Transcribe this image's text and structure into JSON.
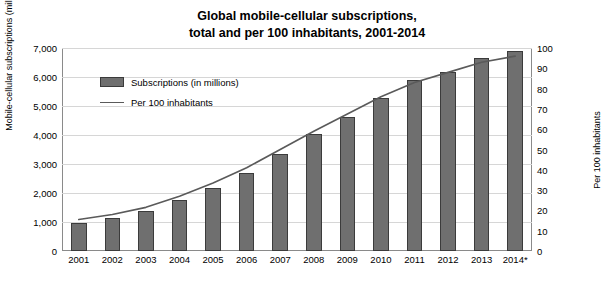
{
  "chart_data": {
    "type": "bar",
    "title": "Global mobile-cellular subscriptions, total and per 100 inhabitants, 2001-2014",
    "title_lines": [
      "Global mobile-cellular subscriptions,",
      "total and per 100 inhabitants, 2001-2014"
    ],
    "xlabel": "",
    "ylabel": "Mobile-cellular subscriptions  (millions)",
    "y2label": "Per 100 inhabitants",
    "categories": [
      "2001",
      "2002",
      "2003",
      "2004",
      "2005",
      "2006",
      "2007",
      "2008",
      "2009",
      "2010",
      "2011",
      "2012",
      "2013",
      "2014*"
    ],
    "ylim": [
      0,
      7000
    ],
    "y2lim": [
      0,
      100
    ],
    "yticks": [
      "0",
      "1,000",
      "2,000",
      "3,000",
      "4,000",
      "5,000",
      "6,000",
      "7,000"
    ],
    "ytick_values": [
      0,
      1000,
      2000,
      3000,
      4000,
      5000,
      6000,
      7000
    ],
    "y2ticks": [
      "0",
      "10",
      "20",
      "30",
      "40",
      "50",
      "60",
      "70",
      "80",
      "90",
      "100"
    ],
    "y2tick_values": [
      0,
      10,
      20,
      30,
      40,
      50,
      60,
      70,
      80,
      90,
      100
    ],
    "grid": false,
    "legend_position": "upper-left-inside",
    "series": [
      {
        "name": "Subscriptions (in millions)",
        "type": "bar",
        "color": "#6f6f6f",
        "axis": "left",
        "values": [
          960,
          1130,
          1380,
          1760,
          2180,
          2700,
          3350,
          4030,
          4630,
          5290,
          5880,
          6180,
          6660,
          6900
        ]
      },
      {
        "name": "Per 100 inhabitants",
        "type": "line",
        "color": "#5a5a5a",
        "axis": "right",
        "values": [
          15.5,
          18.0,
          21.5,
          27.0,
          33.5,
          41.0,
          50.0,
          59.0,
          67.5,
          76.0,
          83.0,
          88.0,
          93.0,
          96.0
        ]
      }
    ]
  },
  "legend": {
    "items": [
      {
        "label": "Subscriptions (in millions)",
        "style": "bar"
      },
      {
        "label": "Per 100 inhabitants",
        "style": "line"
      }
    ]
  }
}
